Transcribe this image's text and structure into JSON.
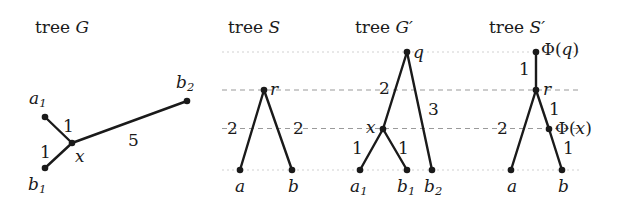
{
  "figure": {
    "background": "#ffffff",
    "ink_color": "#1a1a1a",
    "gridline_color": "#9a9a9a",
    "gridline_color_faint": "#cfcfcf"
  },
  "panels": {
    "g": {
      "title_prefix": "tree ",
      "title_symbol": "G",
      "nodes": {
        "a1_label": "a",
        "a1_sub": "1",
        "x_label": "x",
        "b1_label": "b",
        "b1_sub": "1",
        "b2_label": "b",
        "b2_sub": "2"
      },
      "weights": {
        "x_a1": "1",
        "x_b1": "1",
        "x_b2": "5"
      }
    },
    "s": {
      "title_prefix": "tree ",
      "title_symbol": "S",
      "nodes": {
        "r_label": "r",
        "a_label": "a",
        "b_label": "b"
      },
      "weights": {
        "r_a": "2",
        "r_b": "2"
      }
    },
    "gprime": {
      "title_prefix": "tree ",
      "title_symbol": "G",
      "title_prime": "′",
      "nodes": {
        "q_label": "q",
        "x_label": "x",
        "a1_label": "a",
        "a1_sub": "1",
        "b1_label": "b",
        "b1_sub": "1",
        "b2_label": "b",
        "b2_sub": "2"
      },
      "weights": {
        "q_x": "2",
        "q_b2": "3",
        "x_a1": "1",
        "x_b1": "1"
      }
    },
    "sprime": {
      "title_prefix": "tree ",
      "title_symbol": "S",
      "title_prime": "′",
      "nodes": {
        "phiq_label": "Φ(",
        "phiq_arg": "q",
        "phiq_close": ")",
        "r_label": "r",
        "phix_label": "Φ(",
        "phix_arg": "x",
        "phix_close": ")",
        "a_label": "a",
        "b_label": "b"
      },
      "weights": {
        "phiq_r": "1",
        "r_phix": "1",
        "r_a": "2",
        "phix_b": "1"
      }
    }
  }
}
